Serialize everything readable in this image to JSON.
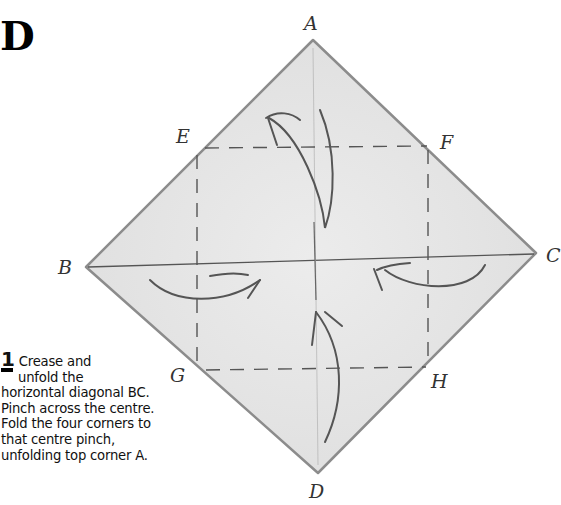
{
  "section": {
    "letter": "D"
  },
  "points": {
    "A": "A",
    "B": "B",
    "C": "C",
    "D": "D",
    "E": "E",
    "F": "F",
    "G": "G",
    "H": "H"
  },
  "step": {
    "number": "1",
    "text_line1": "Crease and",
    "text_line2": "unfold the",
    "text_rest": "horizontal diagonal BC. Pinch across the centre. Fold the four corners to that centre pinch, unfolding top corner A."
  },
  "colors": {
    "paper": "#e4e4e4",
    "edge": "#8a8a8a",
    "line": "#5a5a5a",
    "background": "#ffffff"
  }
}
